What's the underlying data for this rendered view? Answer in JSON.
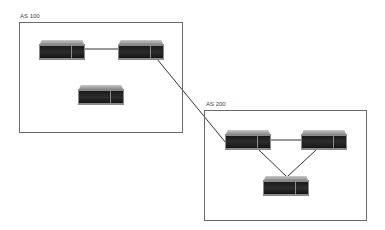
{
  "diagram": {
    "autonomous_systems": [
      {
        "id": "as100",
        "label": "AS 100",
        "box": {
          "x": 19,
          "y": 22,
          "w": 164,
          "h": 111
        },
        "label_pos": {
          "x": 20,
          "y": 13
        }
      },
      {
        "id": "as200",
        "label": "AS 200",
        "box": {
          "x": 204,
          "y": 110,
          "w": 163,
          "h": 111
        },
        "label_pos": {
          "x": 206,
          "y": 101
        }
      }
    ],
    "routers": [
      {
        "id": "r1",
        "as": "AS 100",
        "x": 39,
        "y": 40
      },
      {
        "id": "r2",
        "as": "AS 100",
        "x": 118,
        "y": 40
      },
      {
        "id": "r3",
        "as": "AS 100",
        "x": 78,
        "y": 85
      },
      {
        "id": "r4",
        "as": "AS 200",
        "x": 225,
        "y": 130
      },
      {
        "id": "r5",
        "as": "AS 200",
        "x": 301,
        "y": 130
      },
      {
        "id": "r6",
        "as": "AS 200",
        "x": 263,
        "y": 176
      }
    ],
    "links": [
      {
        "from": "r1",
        "to": "r2",
        "x1": 84,
        "y1": 49,
        "x2": 118,
        "y2": 49
      },
      {
        "from": "r2",
        "to": "r4",
        "x1": 157,
        "y1": 59,
        "x2": 226,
        "y2": 143
      },
      {
        "from": "r4",
        "to": "r5",
        "x1": 271,
        "y1": 140,
        "x2": 301,
        "y2": 140
      },
      {
        "from": "r4",
        "to": "r6",
        "x1": 259,
        "y1": 150,
        "x2": 286,
        "y2": 176
      },
      {
        "from": "r5",
        "to": "r6",
        "x1": 316,
        "y1": 150,
        "x2": 288,
        "y2": 176
      }
    ],
    "colors": {
      "box_border": "#6a6a6a",
      "link": "#333333",
      "router_dark": "#1a1a1a",
      "router_trim": "#8a8a8a"
    }
  }
}
